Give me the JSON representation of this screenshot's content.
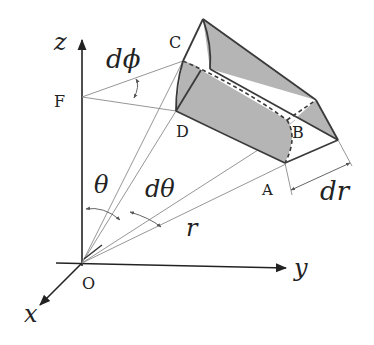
{
  "diagram": {
    "axes": {
      "x": "x",
      "y": "y",
      "z": "z",
      "origin": "O"
    },
    "points": {
      "A": "A",
      "B": "B",
      "C": "C",
      "D": "D",
      "F": "F"
    },
    "symbols": {
      "dphi": "dϕ",
      "theta": "θ",
      "dtheta": "dθ",
      "r": "r",
      "dr": "dr"
    },
    "colors": {
      "line": "#333333",
      "thin": "#8a8a8a",
      "shade": "#b5b5b5"
    }
  }
}
